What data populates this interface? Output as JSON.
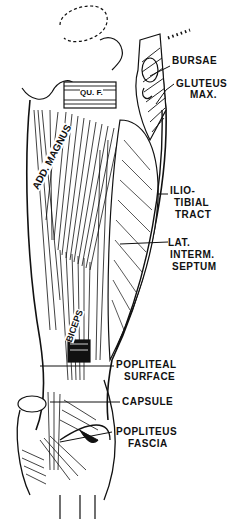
{
  "figure": {
    "colors": {
      "ink": "#111111",
      "background": "#ffffff"
    },
    "labels": {
      "bursae": "BURSAE",
      "gluteus_max_1": "GLUTEUS",
      "gluteus_max_2": "MAX.",
      "iliotibial_1": "ILIO-",
      "iliotibial_2": "TIBIAL",
      "iliotibial_3": "TRACT",
      "lat_septum_1": "LAT.",
      "lat_septum_2": "INTERM.",
      "lat_septum_3": "SEPTUM",
      "popliteal_1": "POPLITEAL",
      "popliteal_2": "SURFACE",
      "capsule": "CAPSULE",
      "popliteus_1": "POPLITEUS",
      "popliteus_2": "FASCIA"
    },
    "inline_labels": {
      "quadratus_femoris": "QU. F.",
      "adductor_magnus": "ADD. MAGNUS",
      "biceps": "BICEPS"
    }
  }
}
